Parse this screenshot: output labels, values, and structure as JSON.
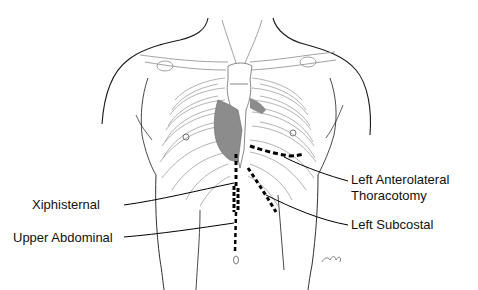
{
  "figure": {
    "colors": {
      "outline": "#1a1a1a",
      "rib_lines": "#9a9a9a",
      "heart_fill": "#8c8c8c",
      "incision": "#000000",
      "text": "#111111"
    }
  },
  "labels": {
    "xiphisternal": "Xiphisternal",
    "upper_abdominal": "Upper Abdominal",
    "left_anterolateral_line1": "Left Anterolateral",
    "left_anterolateral_line2": "Thoracotomy",
    "left_subcostal": "Left Subcostal"
  },
  "signature": "cmf"
}
